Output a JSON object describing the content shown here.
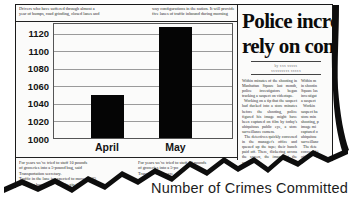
{
  "clipping": {
    "top_left_text": "Drivers who have suffered through almost a\nyear of bumps, road grinding, closed lanes and",
    "top_right_text": "way configurations in the nation. It will provide\nfive lanes of traffic inbound during morning",
    "bottom_left_text": "For years we've tried to stuff 10 pounds\nof groceries into a 5-pound bag, said\nTransportation secretary.\nTraffic in the lane is expected to move 15-25\nmiles per hour when lanes begin the",
    "bottom_right_text": "For years we've tried to stuff 10 pounds\nof groceries into a 5-po\nTransportation secre"
  },
  "article": {
    "headline_line1": "Police incre",
    "headline_line2": "rely on com",
    "byline_line1": "by xxx xxxxx",
    "byline_line2": "xxxxxxxxx xxxxx",
    "body_col1": "Within minutes of the shooting in Manhattan Square last month, police investigators began tracking a suspect on videotape.\n  Working on a tip that the suspect had ducked into a store minutes before the shooting, police figured his image might have been captured on film by today's ubiquitous public eye, a store surveillance camera.\n  The detectives quickly convened in the manager's office and queued up the tape; their hunch paid off. There, flickering across the screen, the image of the suspect.",
    "body_col2": "Within m\nin shootin\nSquare las\ninvestigat\na suspect\n  Workin\nsuspect ha\nstore min\nshooting, p\nimage mi\ncaptured o\nubiquitou\nsurveillanc\n  The dete\nconvened i\noffice and\ntheir hunc\nflickering"
  },
  "chart_data": {
    "type": "bar",
    "title": "Number of Crimes Committed",
    "categories": [
      "April",
      "May"
    ],
    "values": [
      1050,
      1127
    ],
    "xlabel": "",
    "ylabel": "",
    "ylim": [
      1000,
      1132
    ],
    "yticks": [
      1000,
      1020,
      1040,
      1060,
      1080,
      1100,
      1120
    ],
    "grid": true,
    "legend": false,
    "bar_color": "#050505",
    "gridline_color": "#9a9a9a"
  },
  "caption": "Number of Crimes Committed",
  "colors": {
    "paper": "#fbfbfa",
    "ink": "#1a1a1a",
    "tear_edge": "#0d0d0d"
  }
}
